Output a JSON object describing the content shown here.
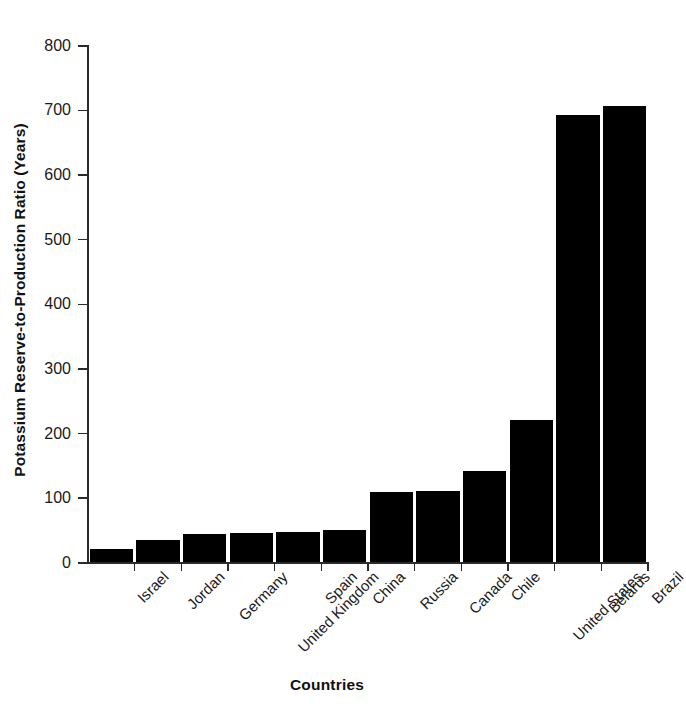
{
  "chart_data": {
    "type": "bar",
    "title": "",
    "xlabel": "Countries",
    "ylabel": "Potassium Reserve-to-Production Ratio (Years)",
    "categories": [
      "Israel",
      "Jordan",
      "Germany",
      "United Kingdom",
      "Spain",
      "China",
      "Russia",
      "Canada",
      "Chile",
      "United States",
      "Belarus",
      "Brazil"
    ],
    "values": [
      20,
      34,
      43,
      45,
      46,
      50,
      108,
      110,
      141,
      220,
      691,
      705
    ],
    "ylim": [
      0,
      800
    ],
    "yticks": [
      0,
      100,
      200,
      300,
      400,
      500,
      600,
      700,
      800
    ],
    "ytick_labels": [
      "0",
      "100",
      "200",
      "300",
      "400",
      "500",
      "600",
      "700",
      "800"
    ],
    "grid": false,
    "legend": false,
    "bar_color": "#000000",
    "axis_color": "#2b2b2b",
    "background": "#ffffff"
  }
}
